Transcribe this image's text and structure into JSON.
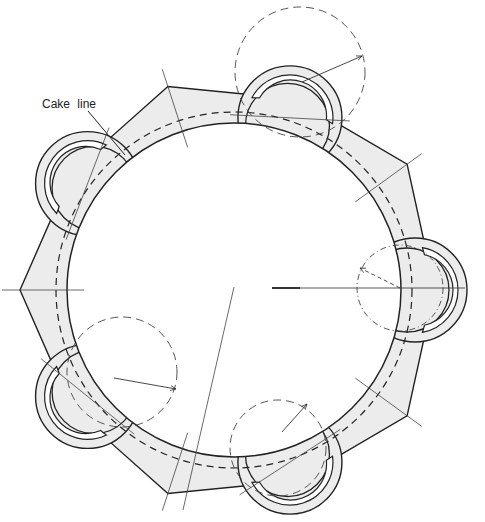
{
  "diagram": {
    "label_cake_line": "Cake line",
    "label_position": {
      "x": 42,
      "y": 97
    },
    "leader": {
      "x1": 88,
      "y1": 111,
      "x2": 125,
      "y2": 155
    },
    "center": {
      "x": 234,
      "y": 290
    },
    "inner_radius": 167,
    "cake_line_radius": 178,
    "star_radius": 214,
    "lobe_distance": 181,
    "lobe_radius": 46,
    "lobe_outer_radius": 52,
    "lobe_angles": [
      0,
      72,
      144,
      216,
      288
    ],
    "star_angles": [
      36,
      108,
      180,
      252,
      324
    ],
    "compass_circles": [
      {
        "cx": 300,
        "cy": 72,
        "r": 65,
        "arrow_to": {
          "x": 362,
          "y": 56
        },
        "arrow_from": {
          "x": 302,
          "y": 82
        }
      },
      {
        "cx": 122,
        "cy": 372,
        "r": 55,
        "arrow_to": {
          "x": 176,
          "y": 389
        },
        "arrow_from": {
          "x": 114,
          "y": 378
        }
      },
      {
        "cx": 278,
        "cy": 448,
        "r": 48,
        "arrow_to": {
          "x": 307,
          "y": 404
        },
        "arrow_from": {
          "x": 282,
          "y": 432
        }
      },
      {
        "cx": 400,
        "cy": 288,
        "r": 43,
        "arrow_to": {
          "x": 360,
          "y": 268
        },
        "arrow_from": {
          "x": 400,
          "y": 288
        }
      }
    ],
    "colors": {
      "fill": "#ececec",
      "stroke": "#222222",
      "guide": "#444444"
    }
  }
}
